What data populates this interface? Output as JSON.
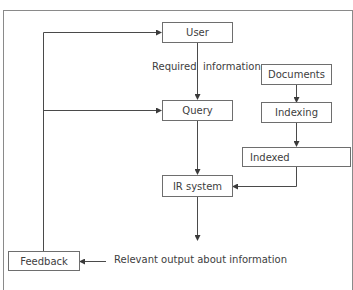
{
  "diagram": {
    "nodes": {
      "user": "User",
      "query": "Query",
      "documents": "Documents",
      "indexing": "Indexing",
      "indexed": "Indexed",
      "ir_system": "IR system",
      "feedback": "Feedback"
    },
    "labels": {
      "required": "Required",
      "information": "information",
      "relevant_output": "Relevant output about information"
    },
    "edges": [
      {
        "from": "User",
        "to": "Query",
        "label": "Required information"
      },
      {
        "from": "Documents",
        "to": "Indexing"
      },
      {
        "from": "Indexing",
        "to": "Indexed"
      },
      {
        "from": "Query",
        "to": "IR system"
      },
      {
        "from": "Indexed",
        "to": "IR system"
      },
      {
        "from": "IR system",
        "to": "Relevant output about information"
      },
      {
        "from": "Relevant output about information",
        "to": "Feedback"
      },
      {
        "from": "Feedback",
        "to": "User"
      },
      {
        "from": "Feedback",
        "to": "Query"
      }
    ],
    "colors": {
      "line": "#4a4a4a",
      "box_border": "#6e6e6e",
      "frame": "#8a8a8a"
    }
  }
}
